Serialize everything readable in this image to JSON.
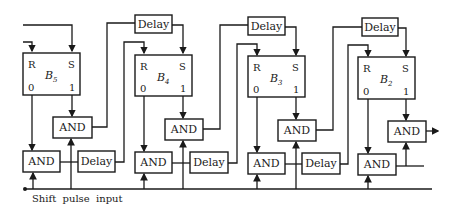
{
  "diagram": {
    "type": "shift-register-logic",
    "colors": {
      "stroke": "#1a1a1a",
      "background": "#ffffff"
    },
    "flip_flops": [
      {
        "id": "B5",
        "name": "B",
        "subscript": "5",
        "reset_pin": "R",
        "set_pin": "S",
        "out0": "0",
        "out1": "1"
      },
      {
        "id": "B4",
        "name": "B",
        "subscript": "4",
        "reset_pin": "R",
        "set_pin": "S",
        "out0": "0",
        "out1": "1"
      },
      {
        "id": "B3",
        "name": "B",
        "subscript": "3",
        "reset_pin": "R",
        "set_pin": "S",
        "out0": "0",
        "out1": "1"
      },
      {
        "id": "B2",
        "name": "B",
        "subscript": "2",
        "reset_pin": "R",
        "set_pin": "S",
        "out0": "0",
        "out1": "1"
      }
    ],
    "delay_label": "Delay",
    "and_label": "AND",
    "top_delays": [
      "Delay",
      "Delay",
      "Delay"
    ],
    "bottom_delays": [
      "Delay",
      "Delay",
      "Delay"
    ],
    "upper_ands": [
      "AND",
      "AND",
      "AND",
      "AND"
    ],
    "lower_ands": [
      "AND",
      "AND",
      "AND",
      "AND"
    ],
    "input_label": "Shift  pulse  input"
  }
}
